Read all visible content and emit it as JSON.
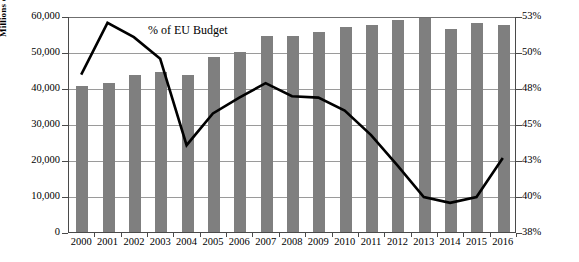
{
  "chart_data": {
    "type": "bar",
    "title": "",
    "subtitle": "",
    "categories": [
      "2000",
      "2001",
      "2002",
      "2003",
      "2004",
      "2005",
      "2006",
      "2007",
      "2008",
      "2009",
      "2010",
      "2011",
      "2012",
      "2013",
      "2014",
      "2015",
      "2016"
    ],
    "xlabel": "",
    "ylabel": "Millions of Euros",
    "ylabel_right": "",
    "ylim": [
      0,
      60000
    ],
    "ylim_right": [
      37.5,
      52.5
    ],
    "yticks": [
      0,
      10000,
      20000,
      30000,
      40000,
      50000,
      60000
    ],
    "ytick_labels": [
      "0",
      "10,000",
      "20,000",
      "30,000",
      "40,000",
      "50,000",
      "60,000"
    ],
    "yticks_right": [
      37.5,
      40,
      42.5,
      45,
      47.5,
      50,
      52.5
    ],
    "ytick_labels_right": [
      "38%",
      "40%",
      "43%",
      "45%",
      "48%",
      "50%",
      "53%"
    ],
    "grid": true,
    "legend_position": "inline-annotation",
    "annotations": [
      {
        "text": "% of EU Budget",
        "series": "line"
      }
    ],
    "series": [
      {
        "name": "Millions of Euros",
        "type": "bar",
        "axis": "left",
        "color": "#7f7f7f",
        "values": [
          40500,
          41500,
          43500,
          44500,
          43500,
          48500,
          50000,
          54500,
          54500,
          55500,
          57000,
          57500,
          59000,
          59500,
          56500,
          58000,
          57500
        ]
      },
      {
        "name": "% of EU Budget",
        "type": "line",
        "axis": "right",
        "color": "#000000",
        "values": [
          48.5,
          52.1,
          51.1,
          49.6,
          43.6,
          45.8,
          46.9,
          47.9,
          47.0,
          46.9,
          46.0,
          44.3,
          42.2,
          40.0,
          39.6,
          40.0,
          42.7
        ]
      }
    ]
  },
  "axis": {
    "left_title": "Millions of Euros"
  },
  "annotation": {
    "line_label": "% of EU Budget"
  }
}
